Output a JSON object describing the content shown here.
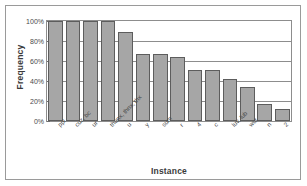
{
  "chart_data": {
    "type": "bar",
    "title": "",
    "xlabel": "Instance",
    "ylabel": "Frequency",
    "ylim": [
      0,
      100
    ],
    "yticks": [
      0,
      20,
      40,
      60,
      80,
      100
    ],
    "ytick_labels": [
      "0%",
      "20%",
      "40%",
      "60%",
      "80%",
      "100%"
    ],
    "grid": true,
    "legend": null,
    "categories": [
      "ppl",
      "cuz, bc",
      "ur",
      "thanx, thnx, thx",
      "u",
      "y",
      "sum",
      "r",
      "4",
      "c",
      "luv, lub",
      "wut",
      "n",
      "2"
    ],
    "values": [
      100,
      100,
      100,
      100,
      89,
      67,
      67,
      64,
      51,
      51,
      42,
      34,
      17,
      12
    ],
    "bar_color": "#a6a6a6",
    "bar_edge_color": "#5d5d5d",
    "axis_color": "#8d8d8d",
    "frame_color": "#9a9a9a",
    "text_color": "#4a4a4a"
  },
  "axes": {
    "y_title": "Frequency",
    "x_title": "Instance"
  }
}
